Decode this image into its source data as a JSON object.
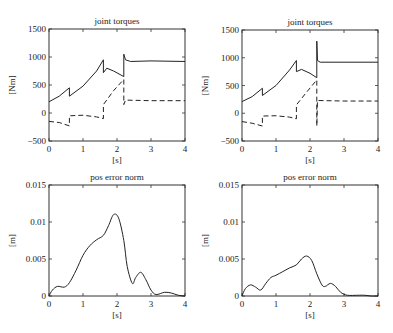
{
  "chart_data": [
    {
      "type": "line",
      "title": "joint torques",
      "xlabel": "[s]",
      "ylabel": "[Nm]",
      "xlim": [
        0,
        4
      ],
      "ylim": [
        -500,
        1500
      ],
      "xticks": [
        "0",
        "1",
        "2",
        "3",
        "4"
      ],
      "yticks": [
        "-500",
        "0",
        "500",
        "1000",
        "1500"
      ],
      "grid": false,
      "series": [
        {
          "name": "joint 1 (solid)",
          "style": "solid",
          "x": [
            0,
            0.3,
            0.6,
            0.6,
            1.0,
            1.4,
            1.6,
            1.6,
            1.7,
            1.9,
            2.2,
            2.2,
            2.25,
            2.4,
            3.0,
            4.0
          ],
          "y": [
            200,
            300,
            450,
            300,
            480,
            750,
            950,
            720,
            800,
            750,
            650,
            1050,
            950,
            920,
            930,
            920
          ]
        },
        {
          "name": "joint 2 (dashed)",
          "style": "dashed",
          "x": [
            0,
            0.3,
            0.6,
            0.6,
            1.0,
            1.4,
            1.6,
            1.6,
            1.9,
            2.2,
            2.2,
            2.25,
            3.0,
            4.0
          ],
          "y": [
            -150,
            -170,
            -230,
            -50,
            -40,
            -70,
            -100,
            150,
            400,
            600,
            150,
            230,
            220,
            220
          ]
        }
      ]
    },
    {
      "type": "line",
      "title": "joint torques",
      "xlabel": "[s]",
      "ylabel": "[Nm]",
      "xlim": [
        0,
        4
      ],
      "ylim": [
        -500,
        1500
      ],
      "xticks": [
        "0",
        "1",
        "2",
        "3",
        "4"
      ],
      "yticks": [
        "-500",
        "0",
        "500",
        "1000",
        "1500"
      ],
      "grid": false,
      "series": [
        {
          "name": "joint 1 (solid)",
          "style": "solid",
          "x": [
            0,
            0.3,
            0.6,
            0.6,
            1.0,
            1.4,
            1.6,
            1.6,
            1.75,
            2.0,
            2.2,
            2.2,
            2.22,
            2.3,
            3.0,
            4.0
          ],
          "y": [
            210,
            300,
            450,
            320,
            500,
            780,
            950,
            750,
            790,
            720,
            640,
            1300,
            950,
            920,
            920,
            920
          ]
        },
        {
          "name": "joint 2 (dashed)",
          "style": "dashed",
          "x": [
            0,
            0.3,
            0.6,
            0.6,
            1.0,
            1.4,
            1.6,
            1.6,
            1.9,
            2.2,
            2.2,
            2.22,
            3.0,
            4.0
          ],
          "y": [
            -150,
            -180,
            -230,
            -50,
            -45,
            -70,
            -100,
            150,
            380,
            600,
            -230,
            230,
            220,
            220
          ]
        }
      ]
    },
    {
      "type": "line",
      "title": "pos error norm",
      "xlabel": "[s]",
      "ylabel": "[m]",
      "xlim": [
        0,
        4
      ],
      "ylim": [
        0,
        0.015
      ],
      "xticks": [
        "0",
        "1",
        "2",
        "3",
        "4"
      ],
      "yticks": [
        "0",
        "0.005",
        "0.01",
        "0.015"
      ],
      "grid": false,
      "series": [
        {
          "name": "pos error norm",
          "style": "solid",
          "x": [
            0,
            0.1,
            0.25,
            0.45,
            0.6,
            0.8,
            1.0,
            1.2,
            1.4,
            1.6,
            1.75,
            1.9,
            2.05,
            2.2,
            2.3,
            2.45,
            2.55,
            2.7,
            2.85,
            3.0,
            3.15,
            3.4,
            3.6,
            3.8,
            4.0
          ],
          "y": [
            0,
            0.0008,
            0.0013,
            0.0012,
            0.0018,
            0.0035,
            0.0055,
            0.0068,
            0.0076,
            0.0082,
            0.0095,
            0.011,
            0.0105,
            0.0075,
            0.004,
            0.0017,
            0.0025,
            0.0032,
            0.0022,
            0.0008,
            0.0002,
            0.0005,
            0.0004,
            0.0001,
            0.0
          ]
        }
      ]
    },
    {
      "type": "line",
      "title": "pos error norm",
      "xlabel": "[s]",
      "ylabel": "[m]",
      "xlim": [
        0,
        4
      ],
      "ylim": [
        0,
        0.015
      ],
      "xticks": [
        "0",
        "1",
        "2",
        "3",
        "4"
      ],
      "yticks": [
        "0",
        "0.005",
        "0.01",
        "0.015"
      ],
      "grid": false,
      "series": [
        {
          "name": "pos error norm",
          "style": "solid",
          "x": [
            0,
            0.1,
            0.25,
            0.4,
            0.55,
            0.7,
            0.85,
            1.0,
            1.2,
            1.4,
            1.6,
            1.75,
            1.9,
            2.05,
            2.2,
            2.35,
            2.45,
            2.6,
            2.75,
            2.9,
            3.1,
            3.4,
            3.6,
            3.8,
            4.0
          ],
          "y": [
            0,
            0.001,
            0.0015,
            0.0012,
            0.0008,
            0.0017,
            0.0025,
            0.0028,
            0.0033,
            0.0038,
            0.0042,
            0.005,
            0.0054,
            0.0048,
            0.003,
            0.0015,
            0.0013,
            0.0017,
            0.0013,
            0.0005,
            0.0001,
            0.0001,
            0.0001,
            0.0,
            0.0
          ]
        }
      ]
    }
  ],
  "panels": [
    {
      "title": "joint torques",
      "ylabel": "[Nm]",
      "xlabel": "[s]"
    },
    {
      "title": "joint torques",
      "ylabel": "[Nm]",
      "xlabel": "[s]"
    },
    {
      "title": "pos error norm",
      "ylabel": "[m]",
      "xlabel": "[s]"
    },
    {
      "title": "pos error norm",
      "ylabel": "[m]",
      "xlabel": "[s]"
    }
  ]
}
